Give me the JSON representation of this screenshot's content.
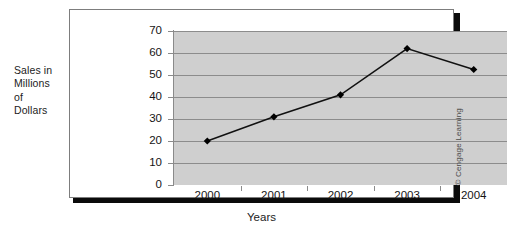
{
  "figure": {
    "y_caption_lines": [
      "Sales in",
      "Millions",
      "of",
      "Dollars"
    ],
    "x_caption": "Years",
    "credit": "© Cengage Learning"
  },
  "colors": {
    "plot_background": "#cfcfcf",
    "gridline": "#8c8c8c",
    "series_line": "#111111",
    "marker": "#000000",
    "frame_border": "#7d7d7d",
    "frame_shadow": "#0b0b0b",
    "text": "#141414"
  },
  "chart_data": {
    "type": "line",
    "title": "",
    "xlabel": "Years",
    "ylabel": "Sales in Millions of Dollars",
    "categories": [
      "2000",
      "2001",
      "2002",
      "2003",
      "2004"
    ],
    "values": [
      20,
      31,
      41,
      62,
      52.5
    ],
    "yticks": [
      0,
      10,
      20,
      30,
      40,
      50,
      60,
      70
    ],
    "ytick_labels": [
      "0",
      "10",
      "20",
      "30",
      "40",
      "50",
      "60",
      "70"
    ],
    "ylim": [
      0,
      70
    ],
    "grid": "horizontal",
    "legend": "none",
    "marker": "diamond",
    "series": [
      {
        "name": "Sales",
        "values": [
          20,
          31,
          41,
          62,
          52.5
        ]
      }
    ]
  }
}
